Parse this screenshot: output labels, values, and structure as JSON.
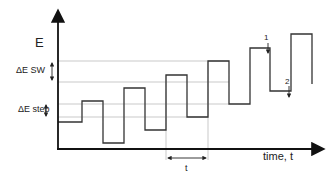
{
  "diagram": {
    "y_axis_label": "E",
    "x_axis_label": "time, t",
    "annotations": {
      "delta_e_sw": "ΔE SW",
      "delta_e_step": "ΔE step",
      "period": "t",
      "marker_1": "1",
      "marker_2": "2"
    },
    "colors": {
      "waveform": "#333333",
      "axes": "#111111",
      "guides": "#bbbbbb"
    },
    "waveform_points": [
      [
        58,
        122
      ],
      [
        82,
        122
      ],
      [
        82,
        101
      ],
      [
        103,
        101
      ],
      [
        103,
        143
      ],
      [
        124,
        143
      ],
      [
        124,
        88
      ],
      [
        145,
        88
      ],
      [
        145,
        130
      ],
      [
        166,
        130
      ],
      [
        166,
        75
      ],
      [
        187,
        75
      ],
      [
        187,
        117
      ],
      [
        208,
        117
      ],
      [
        208,
        61
      ],
      [
        229,
        61
      ],
      [
        229,
        104
      ],
      [
        250,
        104
      ],
      [
        250,
        48
      ],
      [
        270,
        48
      ],
      [
        270,
        91
      ],
      [
        291,
        91
      ],
      [
        291,
        34
      ],
      [
        312,
        34
      ],
      [
        312,
        84
      ]
    ],
    "guide_lines_y": [
      61,
      82,
      104,
      117
    ],
    "guide_lines_x": [
      166,
      208
    ]
  }
}
